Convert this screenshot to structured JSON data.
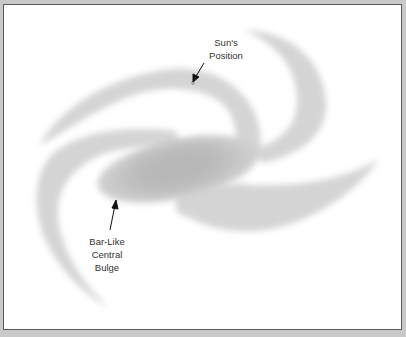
{
  "diagram": {
    "labels": {
      "sun_line1": "Sun's",
      "sun_line2": "Position",
      "bulge_line1": "Bar-Like",
      "bulge_line2": "Central",
      "bulge_line3": "Bulge"
    },
    "colors": {
      "background": "#ffffff",
      "frame": "#c9c9c9",
      "arm": "#d4d4d4",
      "bulge": "#b9b9b9",
      "sun_marker": "#a8a8a8",
      "arrow": "#111111",
      "text": "#333333"
    }
  }
}
